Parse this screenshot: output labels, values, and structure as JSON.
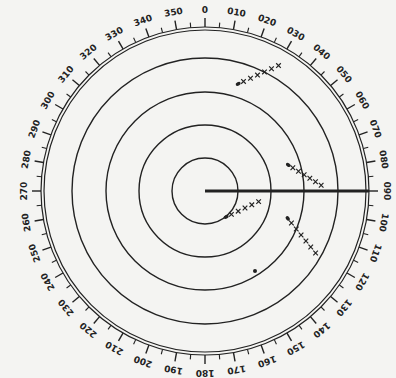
{
  "diagram": {
    "type": "radar-plotting-sheet",
    "center": {
      "x": 205,
      "y": 191
    },
    "range_rings": [
      33,
      66,
      99,
      133
    ],
    "outer_ring_inner_radius": 161,
    "outer_ring_outer_radius": 164,
    "ink_color": "#222222",
    "background_color": "#f4f4f2",
    "bearing_labels": [
      "0",
      "010",
      "020",
      "030",
      "040",
      "050",
      "060",
      "070",
      "080",
      "090",
      "100",
      "110",
      "120",
      "130",
      "140",
      "150",
      "160",
      "170",
      "180",
      "190",
      "200",
      "210",
      "220",
      "230",
      "240",
      "250",
      "260",
      "270",
      "280",
      "290",
      "300",
      "310",
      "320",
      "330",
      "340",
      "350"
    ],
    "heading_line": {
      "bearing": 90,
      "from_radius": 0,
      "to_radius": 164
    },
    "tracks": [
      {
        "name": "contact-1",
        "start": {
          "x": 240,
          "y": 83
        },
        "end": {
          "x": 282,
          "y": 64
        },
        "marks": 6,
        "mark": "x"
      },
      {
        "name": "contact-2",
        "start": {
          "x": 290,
          "y": 166
        },
        "end": {
          "x": 324,
          "y": 187
        },
        "marks": 6,
        "mark": "x"
      },
      {
        "name": "contact-3",
        "start": {
          "x": 228,
          "y": 216
        },
        "end": {
          "x": 262,
          "y": 200
        },
        "marks": 5,
        "mark": "x"
      },
      {
        "name": "contact-4",
        "start": {
          "x": 289,
          "y": 220
        },
        "end": {
          "x": 318,
          "y": 256
        },
        "marks": 6,
        "mark": "x"
      }
    ],
    "points": [
      {
        "name": "own-ship-marker",
        "x": 255,
        "y": 271,
        "r": 2
      }
    ]
  }
}
